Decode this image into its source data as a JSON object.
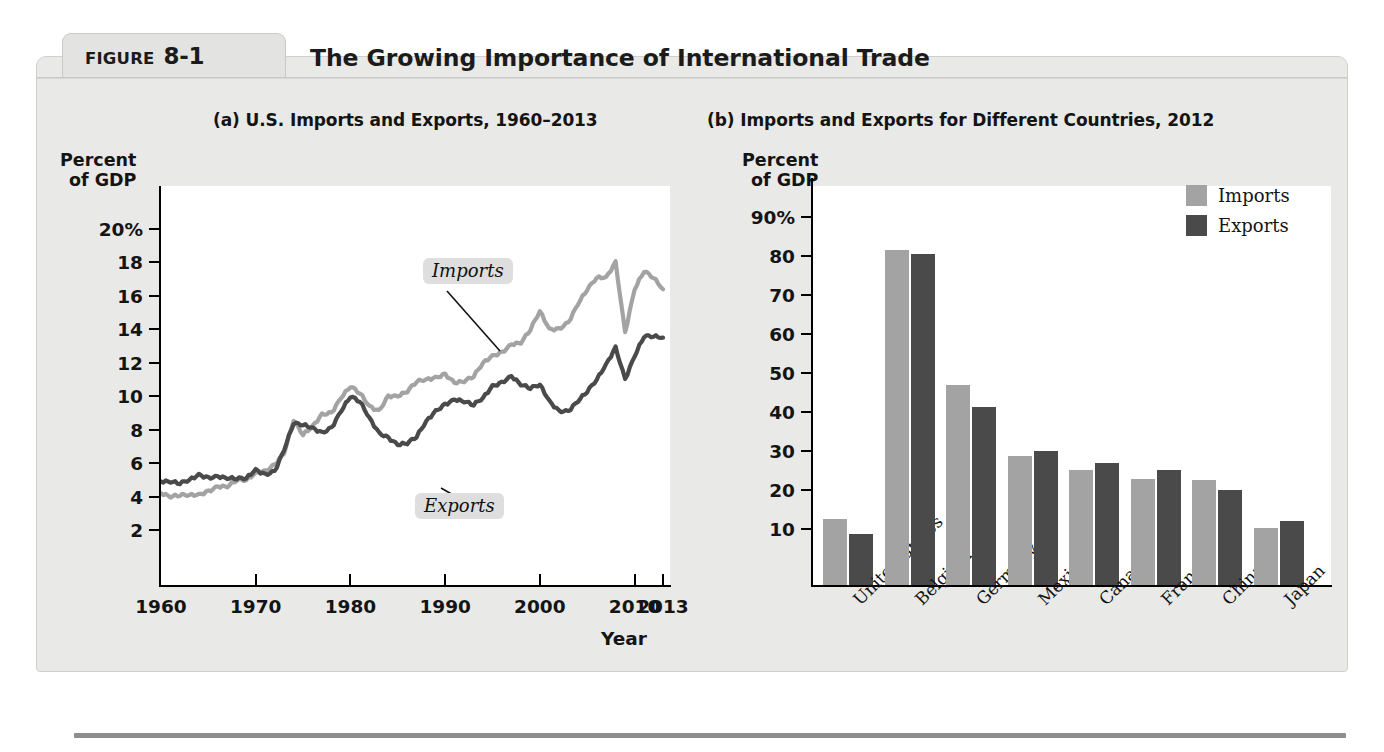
{
  "figure": {
    "tab_word": "FIGURE",
    "tab_number": "8-1",
    "title": "The Growing Importance of International Trade"
  },
  "colors": {
    "imports": "#a3a3a3",
    "exports": "#4a4a4a",
    "axis": "#000000",
    "panel_bg": "#e9e9e7",
    "plot_bg": "#ffffff",
    "callout_bg": "#dedede"
  },
  "panel_a": {
    "heading": "(a) U.S. Imports and Exports, 1960–2013",
    "axis_caption": "Percent\nof GDP",
    "axis_caption_line1": "Percent",
    "axis_caption_line2": "of GDP",
    "xlabel": "Year",
    "y_ticks": [
      "20%",
      "18",
      "16",
      "14",
      "12",
      "10",
      "8",
      "6",
      "4",
      "2"
    ],
    "x_ticks": [
      "1960",
      "1970",
      "1980",
      "1990",
      "2000",
      "2010",
      "2013"
    ],
    "annotations": [
      {
        "name": "imports",
        "text": "Imports"
      },
      {
        "name": "exports",
        "text": "Exports"
      }
    ]
  },
  "panel_b": {
    "heading": "(b) Imports and Exports for Different Countries, 2012",
    "axis_caption_line1": "Percent",
    "axis_caption_line2": "of GDP",
    "y_ticks": [
      "90%",
      "80",
      "70",
      "60",
      "50",
      "40",
      "30",
      "20",
      "10"
    ],
    "legend": [
      {
        "label": "Imports",
        "color": "#a3a3a3"
      },
      {
        "label": "Exports",
        "color": "#4a4a4a"
      }
    ]
  },
  "chart_data": [
    {
      "type": "line",
      "id": "panel-a",
      "title": "(a) U.S. Imports and Exports, 1960–2013",
      "xlabel": "Year",
      "ylabel": "Percent of GDP",
      "xlim": [
        1960,
        2013
      ],
      "ylim": [
        0,
        21
      ],
      "ytick_values": [
        2,
        4,
        6,
        8,
        10,
        12,
        14,
        16,
        18,
        20
      ],
      "xtick_values": [
        1960,
        1970,
        1980,
        1990,
        2000,
        2010,
        2013
      ],
      "grid": false,
      "legend_position": "inline-annotation",
      "series": [
        {
          "name": "Imports",
          "color": "#a3a3a3",
          "x": [
            1960,
            1961,
            1962,
            1963,
            1964,
            1965,
            1966,
            1967,
            1968,
            1969,
            1970,
            1971,
            1972,
            1973,
            1974,
            1975,
            1976,
            1977,
            1978,
            1979,
            1980,
            1981,
            1982,
            1983,
            1984,
            1985,
            1986,
            1987,
            1988,
            1989,
            1990,
            1991,
            1992,
            1993,
            1994,
            1995,
            1996,
            1997,
            1998,
            1999,
            2000,
            2001,
            2002,
            2003,
            2004,
            2005,
            2006,
            2007,
            2008,
            2009,
            2010,
            2011,
            2012,
            2013
          ],
          "values": [
            4.2,
            4.0,
            4.1,
            4.1,
            4.1,
            4.3,
            4.6,
            4.6,
            5.0,
            5.0,
            5.4,
            5.5,
            5.9,
            6.6,
            8.6,
            7.7,
            8.2,
            8.9,
            9.0,
            9.9,
            10.6,
            10.2,
            9.4,
            9.1,
            10.0,
            10.0,
            10.3,
            10.9,
            11.0,
            11.1,
            11.3,
            10.8,
            10.9,
            11.2,
            12.0,
            12.4,
            12.6,
            13.1,
            13.2,
            14.0,
            15.1,
            14.0,
            14.0,
            14.4,
            15.5,
            16.4,
            17.1,
            17.1,
            18.0,
            13.8,
            16.4,
            17.5,
            17.1,
            16.4
          ]
        },
        {
          "name": "Exports",
          "color": "#4a4a4a",
          "x": [
            1960,
            1961,
            1962,
            1963,
            1964,
            1965,
            1966,
            1967,
            1968,
            1969,
            1970,
            1971,
            1972,
            1973,
            1974,
            1975,
            1976,
            1977,
            1978,
            1979,
            1980,
            1981,
            1982,
            1983,
            1984,
            1985,
            1986,
            1987,
            1988,
            1989,
            1990,
            1991,
            1992,
            1993,
            1994,
            1995,
            1996,
            1997,
            1998,
            1999,
            2000,
            2001,
            2002,
            2003,
            2004,
            2005,
            2006,
            2007,
            2008,
            2009,
            2010,
            2011,
            2012,
            2013
          ],
          "values": [
            4.9,
            4.9,
            4.8,
            5.0,
            5.3,
            5.1,
            5.2,
            5.1,
            5.1,
            5.1,
            5.6,
            5.3,
            5.5,
            6.8,
            8.4,
            8.3,
            8.1,
            7.8,
            8.1,
            9.1,
            10.0,
            9.7,
            8.7,
            7.8,
            7.5,
            7.1,
            7.2,
            7.6,
            8.5,
            9.1,
            9.5,
            9.8,
            9.7,
            9.5,
            9.9,
            10.6,
            10.8,
            11.2,
            10.7,
            10.5,
            10.7,
            9.7,
            9.1,
            9.1,
            9.7,
            10.3,
            11.0,
            11.9,
            12.9,
            11.0,
            12.4,
            13.6,
            13.6,
            13.5
          ]
        }
      ]
    },
    {
      "type": "bar",
      "id": "panel-b",
      "title": "(b) Imports and Exports for Different Countries, 2012",
      "xlabel": "",
      "ylabel": "Percent of GDP",
      "ylim": [
        0,
        95
      ],
      "ytick_values": [
        10,
        20,
        30,
        40,
        50,
        60,
        70,
        80,
        90
      ],
      "grid": false,
      "legend_position": "top-right",
      "categories": [
        "United States",
        "Belgium",
        "Germany",
        "Mexico",
        "Canada",
        "France",
        "China",
        "Japan"
      ],
      "series": [
        {
          "name": "Imports",
          "color": "#a3a3a3",
          "values": [
            16.8,
            85.8,
            51.4,
            33.2,
            29.5,
            27.3,
            26.8,
            14.7
          ]
        },
        {
          "name": "Exports",
          "color": "#4a4a4a",
          "values": [
            13.2,
            85.0,
            45.6,
            34.3,
            31.2,
            29.6,
            24.3,
            16.5
          ]
        }
      ]
    }
  ]
}
